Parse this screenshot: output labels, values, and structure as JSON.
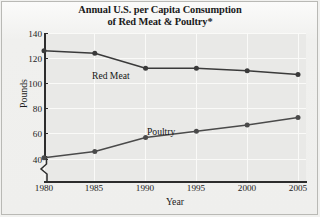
{
  "figure": {
    "title_lines": [
      "Annual U.S. per Capita Consumption",
      "of Red Meat & Poultry*"
    ],
    "title_full": "Annual U.S. per Capita Consumption of Red Meat & Poultry*"
  },
  "axes": {
    "y_title": "Pounds",
    "x_title": "Year",
    "y_ticks": [
      "40",
      "60",
      "80",
      "100",
      "120",
      "140"
    ],
    "x_ticks": [
      "1980",
      "1985",
      "1990",
      "1995",
      "2000",
      "2005"
    ],
    "y_axis_break": "zigzag-break-icon"
  },
  "legend": {
    "red_meat_label": "Red Meat",
    "poultry_label": "Poultry"
  },
  "colors": {
    "series_red_meat": "#3a3a3a",
    "series_poultry": "#4a4a4a",
    "axis": "#2d2d2d",
    "plot_background": "#e9e9e7",
    "figure_background": "#f1f1ef",
    "gridline": "#fafaf8",
    "text": "#1c1c1c"
  },
  "chart_data": {
    "type": "line",
    "title": "Annual U.S. per Capita Consumption of Red Meat & Poultry*",
    "xlabel": "Year",
    "ylabel": "Pounds",
    "x": [
      1980,
      1985,
      1990,
      1995,
      2000,
      2005
    ],
    "categories": [
      "1980",
      "1985",
      "1990",
      "1995",
      "2000",
      "2005"
    ],
    "series": [
      {
        "name": "Red Meat",
        "values": [
          126,
          124,
          112,
          112,
          110,
          107
        ]
      },
      {
        "name": "Poultry",
        "values": [
          41,
          46,
          57,
          62,
          67,
          73
        ]
      }
    ],
    "xlim": [
      1980,
      2005
    ],
    "ylim": [
      40,
      140
    ],
    "ytick_step": 20,
    "xtick_step": 5,
    "grid": true,
    "legend_position": "inline-labels",
    "y_axis_break_below": 40,
    "markers": true,
    "annotations": [
      "* asterisk footnote marker in title"
    ]
  }
}
